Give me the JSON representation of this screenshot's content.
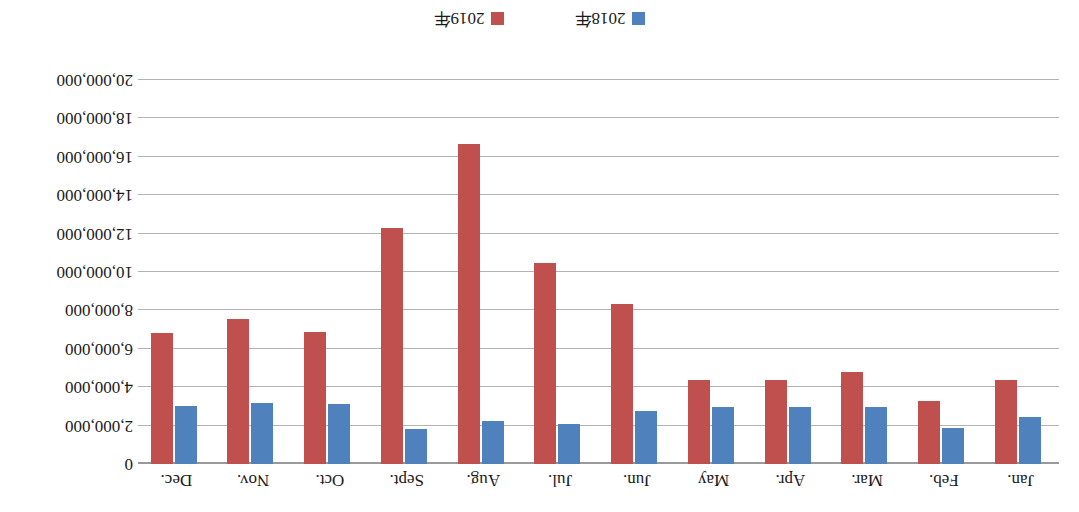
{
  "chart_data": {
    "type": "bar",
    "title": "",
    "xlabel": "",
    "ylabel": "",
    "orientation": "rotated-180",
    "grid": true,
    "legend_position": "bottom",
    "ylim": [
      0,
      20000000
    ],
    "ytick_step": 2000000,
    "ytick_labels": [
      "0",
      "2,000,000",
      "4,000,000",
      "6,000,000",
      "8,000,000",
      "10,000,000",
      "12,000,000",
      "14,000,000",
      "16,000,000",
      "18,000,000",
      "20,000,000"
    ],
    "ytick_values": [
      0,
      2000000,
      4000000,
      6000000,
      8000000,
      10000000,
      12000000,
      14000000,
      16000000,
      18000000,
      20000000
    ],
    "categories": [
      "Jan.",
      "Feb.",
      "Mar.",
      "Apr.",
      "May",
      "Jun.",
      "Jul.",
      "Aug.",
      "Sept.",
      "Oct.",
      "Nov.",
      "Dec."
    ],
    "series": [
      {
        "name": "2018年",
        "color": "#4F81BD",
        "values": [
          2450000,
          1850000,
          2950000,
          2950000,
          2950000,
          2750000,
          2100000,
          2250000,
          1800000,
          3100000,
          3200000,
          3000000
        ]
      },
      {
        "name": "2019年",
        "color": "#C0504D",
        "values": [
          4350000,
          3300000,
          4800000,
          4400000,
          4400000,
          8350000,
          10450000,
          16650000,
          12300000,
          6850000,
          7550000,
          6800000
        ]
      }
    ]
  },
  "legend": {
    "entries": [
      {
        "label": "2018年",
        "color": "#4F81BD"
      },
      {
        "label": "2019年",
        "color": "#C0504D"
      }
    ]
  }
}
